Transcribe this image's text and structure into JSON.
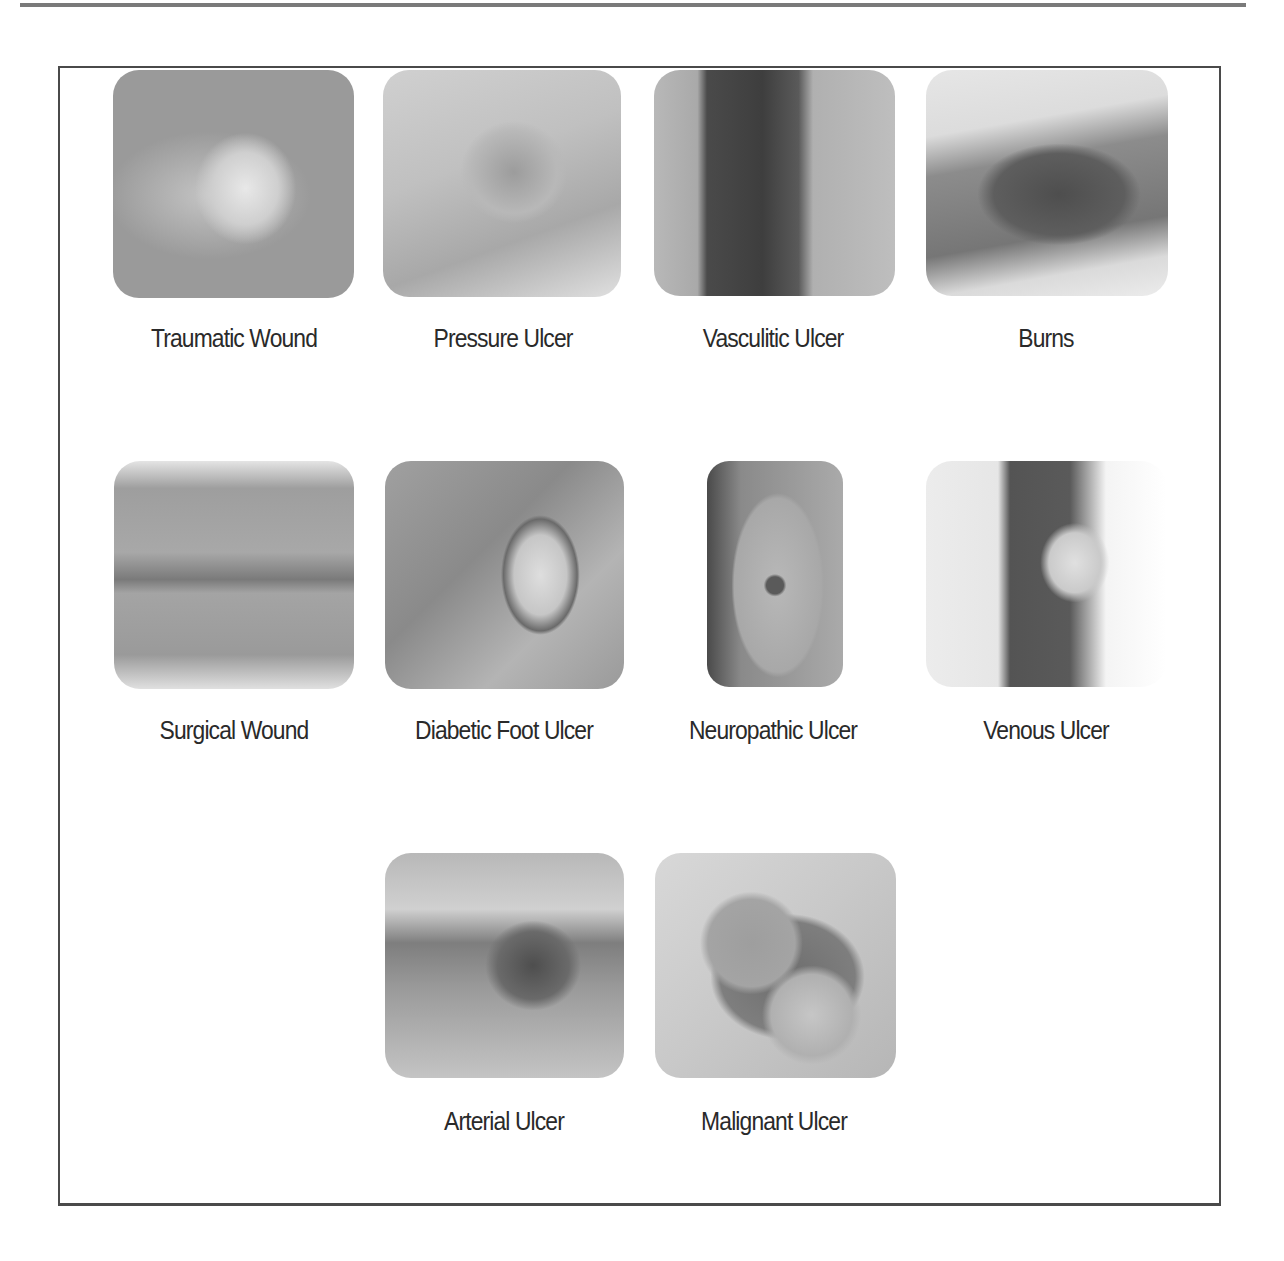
{
  "figure": {
    "panels": [
      {
        "id": "traumatic-wound",
        "label": "Traumatic Wound",
        "row": 1,
        "col": 1,
        "image": "photo of traumatic wound"
      },
      {
        "id": "pressure-ulcer",
        "label": "Pressure Ulcer",
        "row": 1,
        "col": 2,
        "image": "photo of pressure ulcer"
      },
      {
        "id": "vasculitic-ulcer",
        "label": "Vasculitic Ulcer",
        "row": 1,
        "col": 3,
        "image": "photo of vasculitic ulcer"
      },
      {
        "id": "burns",
        "label": "Burns",
        "row": 1,
        "col": 4,
        "image": "photo of burn wound"
      },
      {
        "id": "surgical-wound",
        "label": "Surgical Wound",
        "row": 2,
        "col": 1,
        "image": "photo of sutured surgical wound"
      },
      {
        "id": "diabetic-foot-ulcer",
        "label": "Diabetic Foot Ulcer",
        "row": 2,
        "col": 2,
        "image": "photo of diabetic foot ulcer"
      },
      {
        "id": "neuropathic-ulcer",
        "label": "Neuropathic Ulcer",
        "row": 2,
        "col": 3,
        "image": "photo of neuropathic ulcer on sole of foot"
      },
      {
        "id": "venous-ulcer",
        "label": "Venous Ulcer",
        "row": 2,
        "col": 4,
        "image": "photo of venous ulcer near ankle"
      },
      {
        "id": "arterial-ulcer",
        "label": "Arterial Ulcer",
        "row": 3,
        "col": 2,
        "image": "photo of arterial ulcer"
      },
      {
        "id": "malignant-ulcer",
        "label": "Malignant Ulcer",
        "row": 3,
        "col": 3,
        "image": "photo of malignant ulcer"
      }
    ]
  }
}
